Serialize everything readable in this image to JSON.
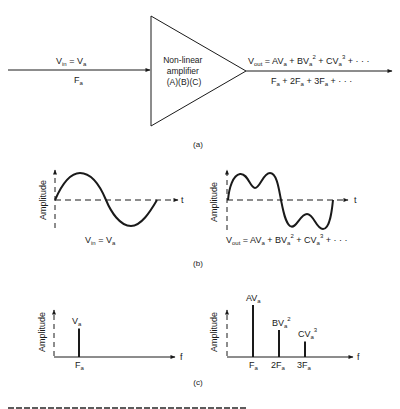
{
  "panel_a": {
    "input_label_top": "V",
    "input_label_top_sub": "in",
    "input_label_top_eq": " = V",
    "input_label_top_eq_sub": "a",
    "input_label_bottom": "F",
    "input_label_bottom_sub": "a",
    "amplifier_lines": [
      "Non-linear",
      "amplifier",
      "(A)(B)(C)"
    ],
    "output_formula": {
      "v": "V",
      "v_sub": "out",
      "terms": [
        {
          "text": " = AV",
          "sub": "a",
          "sup": ""
        },
        {
          "text": " + BV",
          "sub": "a",
          "sup": "2"
        },
        {
          "text": " + CV",
          "sub": "a",
          "sup": "3"
        },
        {
          "text": " + · · ·",
          "sub": "",
          "sup": ""
        }
      ]
    },
    "output_freq": {
      "terms": [
        {
          "text": "F",
          "sub": "a"
        },
        {
          "text": " + 2F",
          "sub": "a"
        },
        {
          "text": " + 3F",
          "sub": "a"
        },
        {
          "text": " + · · ·",
          "sub": ""
        }
      ]
    },
    "caption": "(a)"
  },
  "panel_b": {
    "y_label": "Amplitude",
    "x_label": "t",
    "left_caption": {
      "v": "V",
      "v_sub": "in",
      "eq": " = V",
      "eq_sub": "a"
    },
    "right_caption": {
      "v": "V",
      "v_sub": "out",
      "t1": " = AV",
      "t1_sub": "a",
      "t2": " + BV",
      "t2_sub": "a",
      "t2_sup": "2",
      "t3": " + CV",
      "t3_sub": "a",
      "t3_sup": "3",
      "t4": " + · · ·"
    },
    "caption": "(b)"
  },
  "panel_c": {
    "y_label": "Amplitude",
    "x_label": "f",
    "left_spectrum": [
      {
        "freq_label": "F",
        "freq_sub": "a",
        "amp_label": "V",
        "amp_sub": "a",
        "amp_sup": "",
        "relative_amplitude": 0.55
      }
    ],
    "right_spectrum": [
      {
        "freq_label": "F",
        "freq_sub": "a",
        "amp_label": "AV",
        "amp_sub": "a",
        "amp_sup": "",
        "relative_amplitude": 1.0
      },
      {
        "freq_label": "2F",
        "freq_sub": "a",
        "amp_label": "BV",
        "amp_sub": "a",
        "amp_sup": "2",
        "relative_amplitude": 0.52
      },
      {
        "freq_label": "3F",
        "freq_sub": "a",
        "amp_label": "CV",
        "amp_sub": "a",
        "amp_sup": "3",
        "relative_amplitude": 0.3
      }
    ],
    "caption": "(c)"
  }
}
